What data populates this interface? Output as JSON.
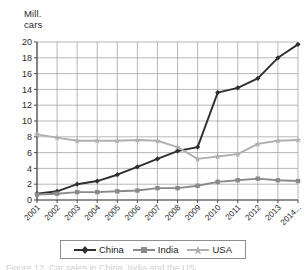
{
  "chart_data": {
    "type": "line",
    "title": "",
    "xlabel": "",
    "ylabel": "Mill.\ncars",
    "ylabel_line1": "Mill.",
    "ylabel_line2": "cars",
    "categories": [
      "2001",
      "2002",
      "2003",
      "2004",
      "2005",
      "2006",
      "2007",
      "2008",
      "2009",
      "2010",
      "2011",
      "2012",
      "2013",
      "2014..."
    ],
    "x": [
      2001,
      2002,
      2003,
      2004,
      2005,
      2006,
      2007,
      2008,
      2009,
      2010,
      2011,
      2012,
      2013,
      2014
    ],
    "ylim": [
      0,
      20
    ],
    "ytick_labels": [
      "0",
      "2",
      "4",
      "6",
      "8",
      "10",
      "12",
      "14",
      "16",
      "18",
      "20"
    ],
    "ytick_values": [
      0,
      2,
      4,
      6,
      8,
      10,
      12,
      14,
      16,
      18,
      20
    ],
    "ytick_step": 2,
    "grid": true,
    "legend_position": "bottom",
    "series": [
      {
        "name": "China",
        "color": "#2f2f2f",
        "marker": "diamond",
        "values": [
          0.8,
          1.1,
          2.0,
          2.4,
          3.2,
          4.2,
          5.2,
          6.2,
          6.7,
          13.6,
          14.2,
          15.4,
          18.0,
          19.7
        ]
      },
      {
        "name": "India",
        "color": "#8a8a8a",
        "marker": "square",
        "values": [
          0.7,
          0.8,
          1.0,
          1.0,
          1.1,
          1.2,
          1.5,
          1.5,
          1.8,
          2.3,
          2.5,
          2.7,
          2.5,
          2.4
        ]
      },
      {
        "name": "USA",
        "color": "#b0b0b0",
        "marker": "star",
        "values": [
          8.3,
          7.9,
          7.5,
          7.5,
          7.5,
          7.6,
          7.5,
          6.7,
          5.2,
          5.5,
          5.8,
          7.1,
          7.5,
          7.6
        ]
      }
    ]
  },
  "legend": {
    "items": [
      {
        "label": "China",
        "color": "#2f2f2f",
        "marker": "diamond"
      },
      {
        "label": "India",
        "color": "#8a8a8a",
        "marker": "square"
      },
      {
        "label": "USA",
        "color": "#b0b0b0",
        "marker": "star"
      }
    ]
  },
  "colors": {
    "china": "#2f2f2f",
    "india": "#8a8a8a",
    "usa": "#b0b0b0",
    "grid": "#9a9a9a",
    "axis": "#6e6e6e",
    "text": "#2a2a2a",
    "background": "#ffffff"
  },
  "caption": {
    "partial_text": "Figure 12. Car sales in China, India and the USA"
  }
}
